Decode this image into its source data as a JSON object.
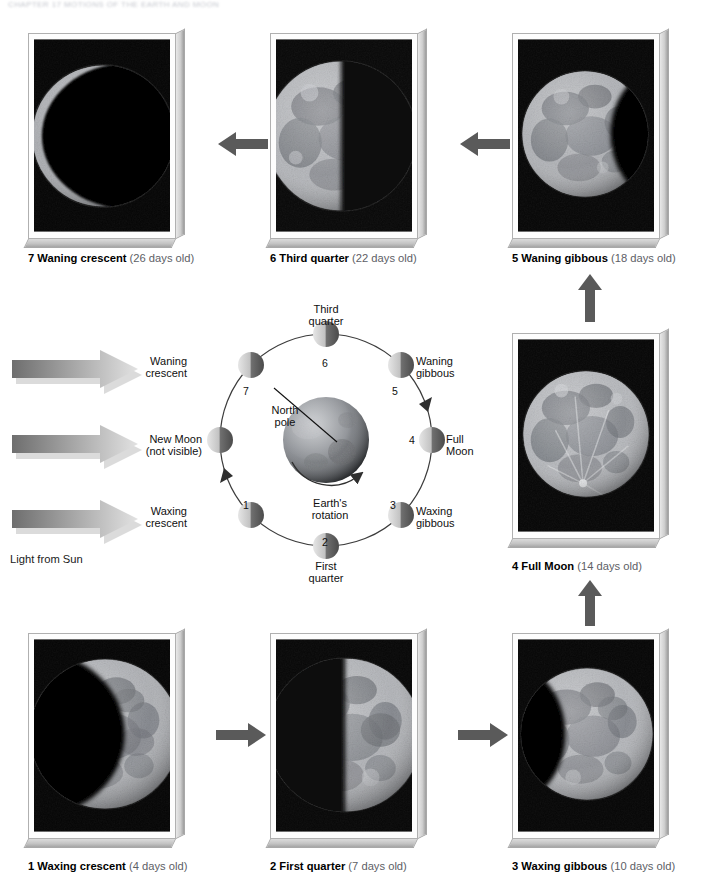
{
  "page": {
    "running_head": "CHAPTER 17  MOTIONS OF THE EARTH AND MOON",
    "background_color": "#ffffff",
    "width": 708,
    "height": 893
  },
  "colors": {
    "arrow_dark_gray": "#5a5a5a",
    "caption_text": "#1a1a1a",
    "caption_age_text": "#5d6066",
    "plate_border": "#b0b0b0",
    "sun_arrow_dark": "#6e6e6e",
    "sun_arrow_light": "#dcdcdc",
    "orbit_line": "#3c3c3c",
    "moon_lit": "#d8d8d8",
    "moon_dark": "#4a4a4a"
  },
  "photos": [
    {
      "id": "waning-crescent-photo",
      "number": "7",
      "phase": "Waning crescent",
      "age": "(26 days old)",
      "caption_number": "7",
      "caption_phase": "Waning crescent",
      "caption_age": "(26 days old)",
      "illumination": "thin crescent lit on left limb",
      "lit_fraction": 0.12,
      "lit_side": "left"
    },
    {
      "id": "third-quarter-photo",
      "number": "6",
      "phase": "Third quarter",
      "age": "(22 days old)",
      "caption_number": "6",
      "caption_phase": "Third quarter",
      "caption_age": "(22 days old)",
      "illumination": "left half lit",
      "lit_fraction": 0.5,
      "lit_side": "left"
    },
    {
      "id": "waning-gibbous-photo",
      "number": "5",
      "phase": "Waning gibbous",
      "age": "(18 days old)",
      "caption_number": "5",
      "caption_phase": "Waning gibbous",
      "caption_age": "(18 days old)",
      "illumination": "mostly lit, dark sliver on right",
      "lit_fraction": 0.78,
      "lit_side": "left"
    },
    {
      "id": "full-moon-photo",
      "number": "4",
      "phase": "Full Moon",
      "age": "(14 days old)",
      "caption_number": "4",
      "caption_phase": "Full Moon",
      "caption_age": "(14 days old)",
      "illumination": "fully lit disc",
      "lit_fraction": 1.0,
      "lit_side": "full"
    },
    {
      "id": "waxing-crescent-photo",
      "number": "1",
      "phase": "Waxing crescent",
      "age": "(4 days old)",
      "caption_number": "1",
      "caption_phase": "Waxing crescent",
      "caption_age": "(4 days old)",
      "illumination": "crescent lit on right limb",
      "lit_fraction": 0.3,
      "lit_side": "right"
    },
    {
      "id": "first-quarter-photo",
      "number": "2",
      "phase": "First quarter",
      "age": "(7 days old)",
      "caption_number": "2",
      "caption_phase": "First quarter",
      "caption_age": "(7 days old)",
      "illumination": "right half lit",
      "lit_fraction": 0.5,
      "lit_side": "right"
    },
    {
      "id": "waxing-gibbous-photo",
      "number": "3",
      "phase": "Waxing gibbous",
      "age": "(10 days old)",
      "caption_number": "3",
      "caption_phase": "Waxing gibbous",
      "caption_age": "(10 days old)",
      "illumination": "mostly lit, dark sliver on left",
      "lit_fraction": 0.8,
      "lit_side": "right"
    }
  ],
  "flow_arrows": [
    {
      "id": "arrow-six-to-seven",
      "direction": "left"
    },
    {
      "id": "arrow-five-to-six",
      "direction": "left"
    },
    {
      "id": "arrow-four-to-five",
      "direction": "up"
    },
    {
      "id": "arrow-three-to-four",
      "direction": "up"
    },
    {
      "id": "arrow-one-to-two",
      "direction": "right"
    },
    {
      "id": "arrow-two-to-three",
      "direction": "right"
    }
  ],
  "sunlight": {
    "label": "Light from Sun",
    "arrow_count": 3,
    "direction": "right"
  },
  "orbit": {
    "earth_label_line1": "North",
    "earth_label_line2": "pole",
    "rotation_label_line1": "Earth's",
    "rotation_label_line2": "rotation",
    "positions": [
      {
        "num": "1",
        "label_line1": "Waxing",
        "label_line2": "crescent",
        "side": "left"
      },
      {
        "num": "2",
        "label_line1": "First",
        "label_line2": "quarter",
        "side": "bottom"
      },
      {
        "num": "3",
        "label_line1": "Waxing",
        "label_line2": "gibbous",
        "side": "right"
      },
      {
        "num": "4",
        "label_line1": "Full",
        "label_line2": "Moon",
        "side": "right"
      },
      {
        "num": "5",
        "label_line1": "Waning",
        "label_line2": "gibbous",
        "side": "right"
      },
      {
        "num": "6",
        "label_line1": "Third",
        "label_line2": "quarter",
        "side": "top"
      },
      {
        "num": "7",
        "label_line1": "Waning",
        "label_line2": "crescent",
        "side": "left"
      },
      {
        "num": "",
        "label_line1": "New Moon",
        "label_line2": "(not visible)",
        "side": "left"
      }
    ]
  }
}
